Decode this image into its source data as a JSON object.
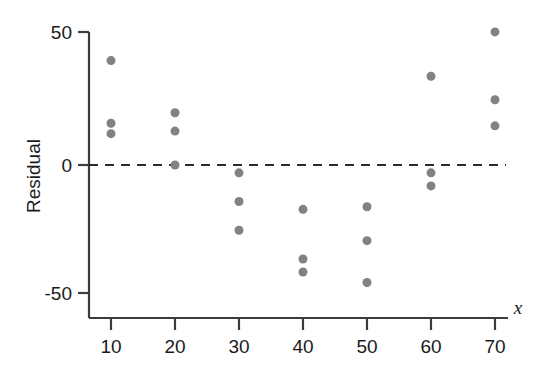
{
  "chart_data": {
    "type": "scatter",
    "title": "",
    "subtitle": "",
    "xlabel": "x",
    "ylabel": "Residual",
    "xlim": [
      5,
      75
    ],
    "ylim": [
      -58,
      56
    ],
    "grid": false,
    "legend": "none",
    "annotations": [
      {
        "name": "zero-reference-line",
        "type": "horizontal-dashed-line",
        "y": 0
      }
    ],
    "x_ticks": [
      10,
      20,
      30,
      40,
      50,
      60,
      70
    ],
    "x_tick_labels": [
      "10",
      "20",
      "30",
      "40",
      "50",
      "60",
      "70"
    ],
    "y_ticks": [
      -50,
      0,
      50
    ],
    "y_tick_labels": [
      "-50",
      "0",
      "50"
    ],
    "marker": {
      "shape": "circle",
      "color": "#828282",
      "size": 9
    },
    "points": [
      {
        "x": 10,
        "y": 40
      },
      {
        "x": 10,
        "y": 16
      },
      {
        "x": 10,
        "y": 12
      },
      {
        "x": 20,
        "y": 20
      },
      {
        "x": 20,
        "y": 13
      },
      {
        "x": 20,
        "y": 0
      },
      {
        "x": 30,
        "y": -3
      },
      {
        "x": 30,
        "y": -14
      },
      {
        "x": 30,
        "y": -25
      },
      {
        "x": 40,
        "y": -17
      },
      {
        "x": 40,
        "y": -36
      },
      {
        "x": 40,
        "y": -41
      },
      {
        "x": 50,
        "y": -16
      },
      {
        "x": 50,
        "y": -29
      },
      {
        "x": 50,
        "y": -45
      },
      {
        "x": 60,
        "y": 34
      },
      {
        "x": 60,
        "y": -3
      },
      {
        "x": 60,
        "y": -8
      },
      {
        "x": 70,
        "y": 51
      },
      {
        "x": 70,
        "y": 25
      },
      {
        "x": 70,
        "y": 15
      }
    ]
  },
  "colors": {
    "marker": "#828282",
    "axis": "#3c3c3c",
    "text": "#1a1a1a",
    "background": "#ffffff"
  }
}
